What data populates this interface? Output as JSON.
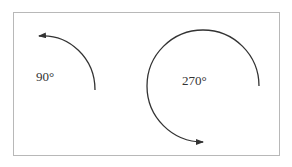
{
  "diagram": {
    "angles": [
      {
        "label": "90°",
        "degrees": 90,
        "direction": "counterclockwise"
      },
      {
        "label": "270°",
        "degrees": 270,
        "direction": "clockwise"
      }
    ],
    "colors": {
      "stroke": "#333333",
      "frame": "#b8b8b8"
    }
  }
}
